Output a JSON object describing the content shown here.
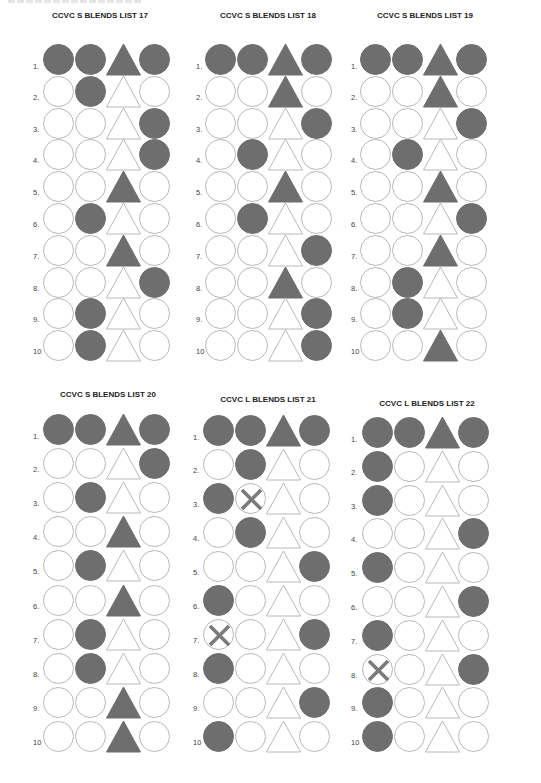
{
  "page": {
    "header_truncated": true
  },
  "colors": {
    "filled": "#6e6e6e",
    "outline": "#b8b8b8",
    "cross": "#7a7a7a",
    "title": "#222222",
    "label": "#444444"
  },
  "shape_columns": [
    "circle",
    "circle",
    "triangle",
    "circle"
  ],
  "panels": [
    {
      "title": "CCVC S BLENDS  LIST 17",
      "rows": [
        {
          "label": "1.",
          "filled": [
            1,
            1,
            1,
            1
          ],
          "crossed": [
            0,
            0,
            0,
            0
          ]
        },
        {
          "label": "2.",
          "filled": [
            0,
            1,
            0,
            0
          ],
          "crossed": [
            0,
            0,
            0,
            0
          ]
        },
        {
          "label": "3.",
          "filled": [
            0,
            0,
            0,
            1
          ],
          "crossed": [
            0,
            0,
            0,
            0
          ]
        },
        {
          "label": "4.",
          "filled": [
            0,
            0,
            0,
            1
          ],
          "crossed": [
            0,
            0,
            0,
            0
          ]
        },
        {
          "label": "5.",
          "filled": [
            0,
            0,
            1,
            0
          ],
          "crossed": [
            0,
            0,
            0,
            0
          ]
        },
        {
          "label": "6.",
          "filled": [
            0,
            1,
            0,
            0
          ],
          "crossed": [
            0,
            0,
            0,
            0
          ]
        },
        {
          "label": "7.",
          "filled": [
            0,
            0,
            1,
            0
          ],
          "crossed": [
            0,
            0,
            0,
            0
          ]
        },
        {
          "label": "8.",
          "filled": [
            0,
            0,
            0,
            1
          ],
          "crossed": [
            0,
            0,
            0,
            0
          ]
        },
        {
          "label": "9.",
          "filled": [
            0,
            1,
            0,
            0
          ],
          "crossed": [
            0,
            0,
            0,
            0
          ]
        },
        {
          "label": "10",
          "filled": [
            0,
            1,
            0,
            0
          ],
          "crossed": [
            0,
            0,
            0,
            0
          ]
        }
      ]
    },
    {
      "title": "CCVC S BLENDS LIST 18",
      "rows": [
        {
          "label": "1.",
          "filled": [
            1,
            1,
            1,
            1
          ],
          "crossed": [
            0,
            0,
            0,
            0
          ]
        },
        {
          "label": "2.",
          "filled": [
            0,
            0,
            1,
            0
          ],
          "crossed": [
            0,
            0,
            0,
            0
          ]
        },
        {
          "label": "3.",
          "filled": [
            0,
            0,
            0,
            1
          ],
          "crossed": [
            0,
            0,
            0,
            0
          ]
        },
        {
          "label": "4.",
          "filled": [
            0,
            1,
            0,
            0
          ],
          "crossed": [
            0,
            0,
            0,
            0
          ]
        },
        {
          "label": "5.",
          "filled": [
            0,
            0,
            1,
            0
          ],
          "crossed": [
            0,
            0,
            0,
            0
          ]
        },
        {
          "label": "6.",
          "filled": [
            0,
            1,
            0,
            0
          ],
          "crossed": [
            0,
            0,
            0,
            0
          ]
        },
        {
          "label": "7.",
          "filled": [
            0,
            0,
            0,
            1
          ],
          "crossed": [
            0,
            0,
            0,
            0
          ]
        },
        {
          "label": "8.",
          "filled": [
            0,
            0,
            1,
            0
          ],
          "crossed": [
            0,
            0,
            0,
            0
          ]
        },
        {
          "label": "9.",
          "filled": [
            0,
            0,
            0,
            1
          ],
          "crossed": [
            0,
            0,
            0,
            0
          ]
        },
        {
          "label": "10",
          "filled": [
            0,
            0,
            0,
            1
          ],
          "crossed": [
            0,
            0,
            0,
            0
          ]
        }
      ]
    },
    {
      "title": "CCVC S BLENDS LIST 19",
      "rows": [
        {
          "label": "1.",
          "filled": [
            1,
            1,
            1,
            1
          ],
          "crossed": [
            0,
            0,
            0,
            0
          ]
        },
        {
          "label": "2.",
          "filled": [
            0,
            0,
            1,
            0
          ],
          "crossed": [
            0,
            0,
            0,
            0
          ]
        },
        {
          "label": "3.",
          "filled": [
            0,
            0,
            0,
            1
          ],
          "crossed": [
            0,
            0,
            0,
            0
          ]
        },
        {
          "label": "4.",
          "filled": [
            0,
            1,
            0,
            0
          ],
          "crossed": [
            0,
            0,
            0,
            0
          ]
        },
        {
          "label": "5.",
          "filled": [
            0,
            0,
            1,
            0
          ],
          "crossed": [
            0,
            0,
            0,
            0
          ]
        },
        {
          "label": "6.",
          "filled": [
            0,
            0,
            0,
            1
          ],
          "crossed": [
            0,
            0,
            0,
            0
          ]
        },
        {
          "label": "7.",
          "filled": [
            0,
            0,
            1,
            0
          ],
          "crossed": [
            0,
            0,
            0,
            0
          ]
        },
        {
          "label": "8.",
          "filled": [
            0,
            1,
            0,
            0
          ],
          "crossed": [
            0,
            0,
            0,
            0
          ]
        },
        {
          "label": "9.",
          "filled": [
            0,
            1,
            0,
            0
          ],
          "crossed": [
            0,
            0,
            0,
            0
          ]
        },
        {
          "label": "10",
          "filled": [
            0,
            0,
            1,
            0
          ],
          "crossed": [
            0,
            0,
            0,
            0
          ]
        }
      ]
    },
    {
      "title": "CCVC S BLENDS LIST 20",
      "rows": [
        {
          "label": "1.",
          "filled": [
            1,
            1,
            1,
            1
          ],
          "crossed": [
            0,
            0,
            0,
            0
          ]
        },
        {
          "label": "2.",
          "filled": [
            0,
            0,
            0,
            1
          ],
          "crossed": [
            0,
            0,
            0,
            0
          ]
        },
        {
          "label": "3.",
          "filled": [
            0,
            1,
            0,
            0
          ],
          "crossed": [
            0,
            0,
            0,
            0
          ]
        },
        {
          "label": "4.",
          "filled": [
            0,
            0,
            1,
            0
          ],
          "crossed": [
            0,
            0,
            0,
            0
          ]
        },
        {
          "label": "5.",
          "filled": [
            0,
            1,
            0,
            0
          ],
          "crossed": [
            0,
            0,
            0,
            0
          ]
        },
        {
          "label": "6.",
          "filled": [
            0,
            0,
            1,
            0
          ],
          "crossed": [
            0,
            0,
            0,
            0
          ]
        },
        {
          "label": "7.",
          "filled": [
            0,
            1,
            0,
            0
          ],
          "crossed": [
            0,
            0,
            0,
            0
          ]
        },
        {
          "label": "8.",
          "filled": [
            0,
            1,
            0,
            0
          ],
          "crossed": [
            0,
            0,
            0,
            0
          ]
        },
        {
          "label": "9.",
          "filled": [
            0,
            0,
            1,
            0
          ],
          "crossed": [
            0,
            0,
            0,
            0
          ]
        },
        {
          "label": "10",
          "filled": [
            0,
            0,
            1,
            0
          ],
          "crossed": [
            0,
            0,
            0,
            0
          ]
        }
      ]
    },
    {
      "title": "CCVC  L BLENDS LIST 21",
      "rows": [
        {
          "label": "1.",
          "filled": [
            1,
            1,
            1,
            1
          ],
          "crossed": [
            0,
            0,
            0,
            0
          ]
        },
        {
          "label": "2.",
          "filled": [
            0,
            1,
            0,
            0
          ],
          "crossed": [
            0,
            0,
            0,
            0
          ]
        },
        {
          "label": "3.",
          "filled": [
            1,
            0,
            0,
            0
          ],
          "crossed": [
            0,
            1,
            0,
            0
          ]
        },
        {
          "label": "4.",
          "filled": [
            0,
            1,
            0,
            0
          ],
          "crossed": [
            0,
            0,
            0,
            0
          ]
        },
        {
          "label": "5.",
          "filled": [
            0,
            0,
            0,
            1
          ],
          "crossed": [
            0,
            0,
            0,
            0
          ]
        },
        {
          "label": "6.",
          "filled": [
            1,
            0,
            0,
            0
          ],
          "crossed": [
            0,
            0,
            0,
            0
          ]
        },
        {
          "label": "7.",
          "filled": [
            0,
            0,
            0,
            1
          ],
          "crossed": [
            1,
            0,
            0,
            0
          ]
        },
        {
          "label": "8.",
          "filled": [
            1,
            0,
            0,
            0
          ],
          "crossed": [
            0,
            0,
            0,
            0
          ]
        },
        {
          "label": "9.",
          "filled": [
            0,
            0,
            0,
            1
          ],
          "crossed": [
            0,
            0,
            0,
            0
          ]
        },
        {
          "label": "10",
          "filled": [
            1,
            0,
            0,
            0
          ],
          "crossed": [
            0,
            0,
            0,
            0
          ]
        }
      ]
    },
    {
      "title": "CCVC L BLENDS LIST 22",
      "rows": [
        {
          "label": "1.",
          "filled": [
            1,
            1,
            1,
            1
          ],
          "crossed": [
            0,
            0,
            0,
            0
          ]
        },
        {
          "label": "2.",
          "filled": [
            1,
            0,
            0,
            0
          ],
          "crossed": [
            0,
            0,
            0,
            0
          ]
        },
        {
          "label": "3.",
          "filled": [
            1,
            0,
            0,
            0
          ],
          "crossed": [
            0,
            0,
            0,
            0
          ]
        },
        {
          "label": "4.",
          "filled": [
            0,
            0,
            0,
            1
          ],
          "crossed": [
            0,
            0,
            0,
            0
          ]
        },
        {
          "label": "5.",
          "filled": [
            1,
            0,
            0,
            0
          ],
          "crossed": [
            0,
            0,
            0,
            0
          ]
        },
        {
          "label": "6.",
          "filled": [
            0,
            0,
            0,
            1
          ],
          "crossed": [
            0,
            0,
            0,
            0
          ]
        },
        {
          "label": "7.",
          "filled": [
            1,
            0,
            0,
            0
          ],
          "crossed": [
            0,
            0,
            0,
            0
          ]
        },
        {
          "label": "8.",
          "filled": [
            0,
            0,
            0,
            1
          ],
          "crossed": [
            1,
            0,
            0,
            0
          ]
        },
        {
          "label": "9.",
          "filled": [
            1,
            0,
            0,
            0
          ],
          "crossed": [
            0,
            0,
            0,
            0
          ]
        },
        {
          "label": "10",
          "filled": [
            1,
            0,
            0,
            0
          ],
          "crossed": [
            0,
            0,
            0,
            0
          ]
        }
      ]
    }
  ]
}
